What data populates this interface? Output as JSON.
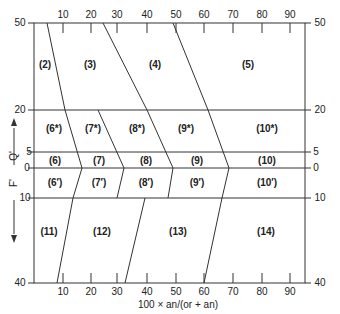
{
  "diagram": {
    "x_axis": {
      "title": "100 × an/(or + an)",
      "ticks_top": [
        "10",
        "20",
        "30",
        "40",
        "50",
        "60",
        "70",
        "80",
        "90"
      ],
      "ticks_bottom": [
        "10",
        "20",
        "30",
        "40",
        "50",
        "60",
        "70",
        "80",
        "90"
      ]
    },
    "y_axis": {
      "left_labels": [
        "50",
        "20",
        "5",
        "0",
        "10",
        "40"
      ],
      "right_labels": [
        "50",
        "20",
        "5",
        "0",
        "10",
        "40"
      ],
      "q_label": "Q'",
      "f_label": "F'"
    },
    "regions": {
      "r2": "(2)",
      "r3": "(3)",
      "r4": "(4)",
      "r5": "(5)",
      "r6s": "(6*)",
      "r7s": "(7*)",
      "r8s": "(8*)",
      "r9s": "(9*)",
      "r10s": "(10*)",
      "r6": "(6)",
      "r7": "(7)",
      "r8": "(8)",
      "r9": "(9)",
      "r10": "(10)",
      "r6p": "(6′)",
      "r7p": "(7′)",
      "r8p": "(8′)",
      "r9p": "(9′)",
      "r10p": "(10′)",
      "r11": "(11)",
      "r12": "(12)",
      "r13": "(13)",
      "r14": "(14)"
    },
    "colors": {
      "line": "#333333",
      "text": "#222222",
      "background": "#ffffff"
    }
  }
}
